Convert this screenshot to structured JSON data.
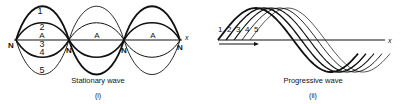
{
  "stationary": {
    "curve_labels": [
      "1",
      "2",
      "3",
      "4",
      "5"
    ],
    "node_label": "N",
    "antinode_label": "A",
    "axis_label": "x",
    "caption": "Stationary wave",
    "sub_caption": "(i)"
  },
  "progressive": {
    "curve_labels": [
      "1",
      "2",
      "3",
      "4",
      "5"
    ],
    "axis_label": "x",
    "caption": "Progressive wave",
    "sub_caption": "(ii)"
  },
  "colors": {
    "ink": "#111111",
    "background": "#ffffff"
  }
}
